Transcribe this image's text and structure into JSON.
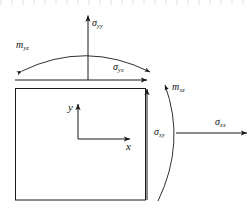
{
  "figure": {
    "type": "mechanics-stress-element-diagram",
    "background_color": "#ffffff",
    "line_color": "#1a1a1a",
    "element": {
      "shape": "square",
      "x": 15,
      "y": 88,
      "width": 130,
      "height": 112
    },
    "axes": {
      "origin_x": 78,
      "origin_y": 139,
      "x_axis_label": "x",
      "y_axis_label": "y",
      "x_axis_length": 54,
      "y_axis_length": 36
    },
    "labels": {
      "sigma_yy": {
        "symbol": "σ",
        "subscript": "yy",
        "x": 92,
        "y": 20
      },
      "sigma_yx": {
        "symbol": "σ",
        "subscript": "yx",
        "x": 113,
        "y": 64
      },
      "sigma_xx": {
        "symbol": "σ",
        "subscript": "xx",
        "x": 215,
        "y": 118
      },
      "sigma_xy": {
        "symbol": "σ",
        "subscript": "xy",
        "x": 155,
        "y": 128
      },
      "m_yz": {
        "symbol": "m",
        "subscript": "yz",
        "x": 16,
        "y": 41
      },
      "m_xz": {
        "symbol": "m",
        "subscript": "xz",
        "x": 172,
        "y": 83
      }
    },
    "arrows": {
      "sigma_yy_arrow": {
        "from_x": 88,
        "from_y": 80,
        "to_x": 88,
        "to_y": 14,
        "direction": "up"
      },
      "sigma_yx_arrow": {
        "from_x": 15,
        "from_y": 80,
        "to_x": 148,
        "to_y": 80,
        "direction": "right"
      },
      "sigma_xx_arrow": {
        "from_x": 176,
        "from_y": 133,
        "to_x": 248,
        "to_y": 133,
        "direction": "right"
      },
      "sigma_xy_arrow": {
        "from_x": 147,
        "from_y": 200,
        "to_x": 147,
        "to_y": 88,
        "direction": "up"
      }
    },
    "moment_arcs": {
      "m_yz_arc": {
        "orientation": "horizontal-top",
        "arrow_ends": "both",
        "from_x": 20,
        "from_y": 64,
        "to_x": 152,
        "to_y": 74
      },
      "m_xz_arc": {
        "orientation": "vertical-right",
        "arrow_ends": "top",
        "from_x": 158,
        "from_y": 200,
        "to_x": 166,
        "to_y": 84
      }
    }
  }
}
